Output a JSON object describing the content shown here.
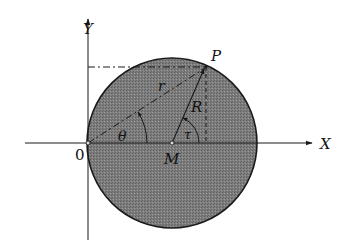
{
  "figure": {
    "axes": {
      "x_label": "X",
      "y_label": "Y",
      "origin_label": "0"
    },
    "points": {
      "P": "P",
      "M": "M",
      "O": "0"
    },
    "segments": {
      "OP_label": "r",
      "MP_label": "R"
    },
    "angles": {
      "at_O": "θ",
      "at_M": "τ"
    },
    "colors": {
      "disk_fill": "#7a7a7a",
      "line": "#1a1a1a",
      "background": "#ffffff"
    }
  }
}
